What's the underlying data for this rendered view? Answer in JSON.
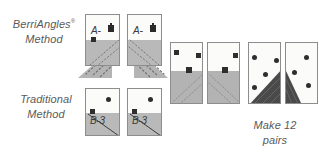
{
  "figure": {
    "background_color": "#ffffff",
    "ink_color": "#4a4a4a"
  },
  "labels": {
    "berriangles": {
      "line1": "BerriAngles",
      "mark": "®",
      "line2": "Method"
    },
    "traditional": {
      "line1": "Traditional",
      "line2": "Method"
    },
    "make_pairs": {
      "line1": "Make 12",
      "line2": "pairs"
    }
  },
  "cards": {
    "berriangles_pair": [
      {
        "name": "card-a-left",
        "label": "A-",
        "glyph": "dark-marker-glyph"
      },
      {
        "name": "card-a-right",
        "label": "A-",
        "glyph": "dark-marker-glyph"
      }
    ],
    "traditional_pair": [
      {
        "name": "card-b-left",
        "label": "B-3"
      },
      {
        "name": "card-b-right",
        "label": "B-3"
      }
    ]
  },
  "panels": {
    "middle_pair": [
      {
        "name": "panel-middle-left",
        "fill": "half-gray",
        "dots": 3
      },
      {
        "name": "panel-middle-right",
        "fill": "half-gray",
        "dots": 3
      }
    ],
    "right_pair": [
      {
        "name": "panel-right-left",
        "fill": "diagonal-dark-triangle",
        "dots": 3
      },
      {
        "name": "panel-right-right",
        "fill": "diagonal-dark-triangle",
        "dots": 3
      }
    ]
  },
  "colors": {
    "card_border": "#8d8d8d",
    "card_face": "#fbfbfa",
    "gray_fill": "#b9b9b9",
    "dark_fill": "#4a4a4a",
    "dot": "#2e2e2e",
    "flare": "#b4b4b4"
  }
}
